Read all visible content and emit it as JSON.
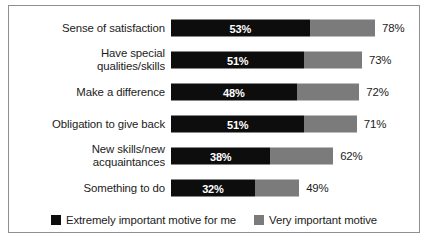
{
  "chart_data": {
    "type": "bar",
    "orientation": "horizontal",
    "stacked": true,
    "title": "",
    "subtitle": "",
    "xlabel": "",
    "ylabel": "",
    "xlim": [
      0,
      78
    ],
    "grid": false,
    "legend_position": "bottom",
    "categories": [
      "Sense of satisfaction",
      "Have special qualities/skills",
      "Make a difference",
      "Obligation to give back",
      "New skills/new acquaintances",
      "Something to do"
    ],
    "series": [
      {
        "name": "Extremely important motive for me",
        "color": "#0d0d0d",
        "values": [
          53,
          51,
          48,
          51,
          38,
          32
        ],
        "value_labels": [
          "53%",
          "51%",
          "48%",
          "51%",
          "38%",
          "32%"
        ]
      },
      {
        "name": "Very important motive",
        "color": "#7b7b7b",
        "values": [
          25,
          22,
          24,
          20,
          24,
          17
        ],
        "value_labels": [
          "",
          "",
          "",
          "",
          "",
          ""
        ]
      }
    ],
    "totals": [
      78,
      73,
      72,
      71,
      62,
      49
    ],
    "total_labels": [
      "78%",
      "73%",
      "72%",
      "71%",
      "62%",
      "49%"
    ]
  },
  "rows": [
    {
      "label_line1": "Sense of satisfaction",
      "label_line2": "",
      "dark_label": "53%",
      "total_label": "78%"
    },
    {
      "label_line1": "Have special",
      "label_line2": "qualities/skills",
      "dark_label": "51%",
      "total_label": "73%"
    },
    {
      "label_line1": "Make a difference",
      "label_line2": "",
      "dark_label": "48%",
      "total_label": "72%"
    },
    {
      "label_line1": "Obligation to give back",
      "label_line2": "",
      "dark_label": "51%",
      "total_label": "71%"
    },
    {
      "label_line1": "New skills/new",
      "label_line2": "acquaintances",
      "dark_label": "38%",
      "total_label": "62%"
    },
    {
      "label_line1": "Something to do",
      "label_line2": "",
      "dark_label": "32%",
      "total_label": "49%"
    }
  ],
  "legend": {
    "items": [
      {
        "label": "Extremely important motive for me",
        "color": "#0d0d0d"
      },
      {
        "label": "Very important motive",
        "color": "#7b7b7b"
      }
    ]
  },
  "colors": {
    "dark_series": "#0d0d0d",
    "gray_series": "#7b7b7b",
    "frame_border": "#8d8f92",
    "background": "#ffffff",
    "text": "#1b1b1b"
  }
}
